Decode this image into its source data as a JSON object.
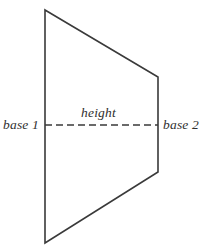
{
  "figure": {
    "name": "trapezoid-diagram",
    "shape": "trapezoid",
    "background_color": "#ffffff",
    "stroke_color": "#3a3a3a",
    "text_color": "#2f2f2f",
    "stroke_width": 1.6,
    "labels": {
      "base1": "base 1",
      "base2": "base 2",
      "height": "height"
    },
    "geometry": {
      "outline_points": "45,10 158,77 158,172 45,243",
      "vertices": [
        {
          "name": "top-left",
          "x": 45,
          "y": 10
        },
        {
          "name": "top-right",
          "x": 158,
          "y": 77
        },
        {
          "name": "bottom-right",
          "x": 158,
          "y": 172
        },
        {
          "name": "bottom-left",
          "x": 45,
          "y": 243
        }
      ],
      "height_line": {
        "x1": 45,
        "y1": 125,
        "x2": 158,
        "y2": 125,
        "dash": "7 4"
      }
    }
  }
}
